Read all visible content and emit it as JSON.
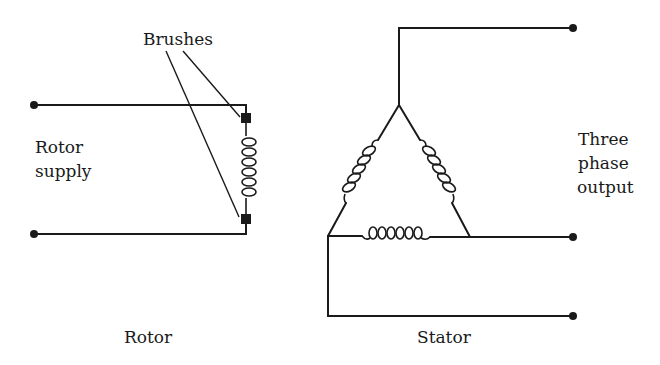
{
  "diagram": {
    "labels": {
      "brushes": "Brushes",
      "rotor_supply_line1": "Rotor",
      "rotor_supply_line2": "supply",
      "three_phase_line1": "Three",
      "three_phase_line2": "phase",
      "three_phase_line3": "output",
      "rotor": "Rotor",
      "stator": "Stator"
    },
    "colors": {
      "line": "#1a1a1a",
      "background": "#ffffff"
    },
    "components": {
      "rotor": {
        "terminals": 2,
        "brushes": 2,
        "coil": "rotor-winding"
      },
      "stator": {
        "connection": "delta",
        "windings": 3,
        "output_terminals": 3
      }
    }
  }
}
